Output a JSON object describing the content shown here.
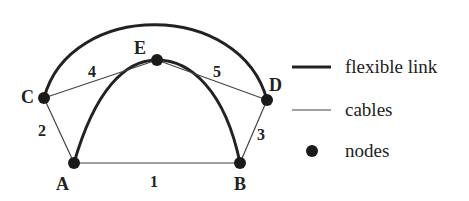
{
  "diagram": {
    "nodes": [
      {
        "id": "A",
        "label": "A",
        "x": 74,
        "y": 163
      },
      {
        "id": "B",
        "label": "B",
        "x": 240,
        "y": 163
      },
      {
        "id": "C",
        "label": "C",
        "x": 44,
        "y": 98
      },
      {
        "id": "D",
        "label": "D",
        "x": 267,
        "y": 100
      },
      {
        "id": "E",
        "label": "E",
        "x": 157,
        "y": 60
      }
    ],
    "cables": [
      {
        "id": "1",
        "label": "1",
        "from": "A",
        "to": "B"
      },
      {
        "id": "2",
        "label": "2",
        "from": "A",
        "to": "C"
      },
      {
        "id": "3",
        "label": "3",
        "from": "B",
        "to": "D"
      },
      {
        "id": "4",
        "label": "4",
        "from": "C",
        "to": "E"
      },
      {
        "id": "5",
        "label": "5",
        "from": "E",
        "to": "D"
      }
    ],
    "flexible_links": [
      {
        "from": "C",
        "to": "D",
        "shape": "outer-arc"
      },
      {
        "from": "A",
        "to": "B",
        "via": "E",
        "shape": "inner-arc"
      }
    ]
  },
  "legend": {
    "flexible_link": "flexible link",
    "cables": "cables",
    "nodes": "nodes"
  },
  "colors": {
    "line": "#222222",
    "node": "#1a1a1a"
  }
}
